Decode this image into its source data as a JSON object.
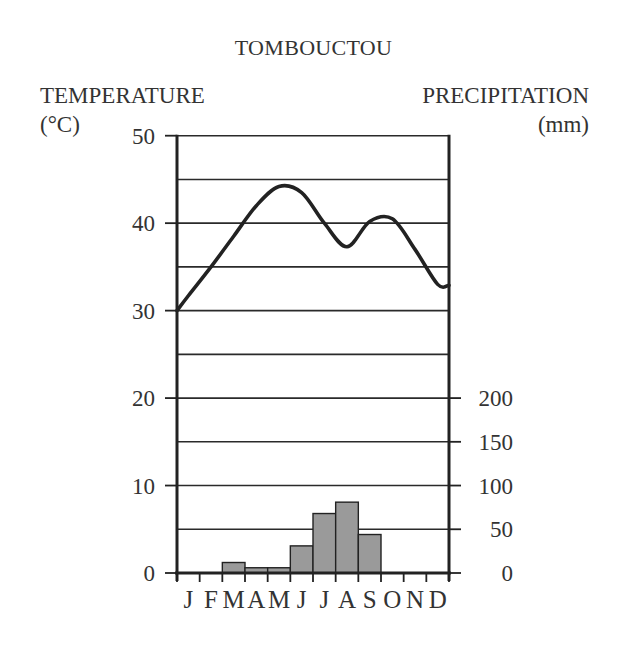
{
  "chart_data": {
    "type": "climograph",
    "title": "TOMBOUCTOU",
    "left_axis": {
      "title": "TEMPERATURE",
      "unit": "(°C)",
      "ticks": [
        0,
        10,
        20,
        30,
        40,
        50
      ],
      "range": [
        0,
        50
      ],
      "minor_gridlines": [
        5,
        15,
        25,
        35,
        45
      ]
    },
    "right_axis": {
      "title": "PRECIPITATION",
      "unit": "(mm)",
      "ticks": [
        0,
        50,
        100,
        150,
        200
      ],
      "range": [
        0,
        200
      ]
    },
    "categories": [
      "J",
      "F",
      "M",
      "A",
      "M",
      "J",
      "J",
      "A",
      "S",
      "O",
      "N",
      "D"
    ],
    "series": [
      {
        "name": "Temperature (°C)",
        "type": "line",
        "color": "#222222",
        "values": [
          31.7,
          35.0,
          38.5,
          42.0,
          44.2,
          43.5,
          40.0,
          37.3,
          40.2,
          40.5,
          37.0,
          33.0
        ],
        "start_value": 30.0,
        "end_value": 32.9
      },
      {
        "name": "Precipitation (mm)",
        "type": "bar",
        "color": "#9a9a9a",
        "values": [
          0,
          0,
          12,
          6,
          6,
          31,
          68,
          81,
          44,
          0,
          0,
          0
        ]
      }
    ],
    "grid": true,
    "xlabel": "",
    "ylabel": "TEMPERATURE (°C)",
    "y2label": "PRECIPITATION (mm)"
  },
  "colors": {
    "axis": "#222222",
    "grid": "#2a2a2a",
    "bar_fill": "#9a9a9a",
    "bar_stroke": "#222222",
    "text": "#333333"
  }
}
